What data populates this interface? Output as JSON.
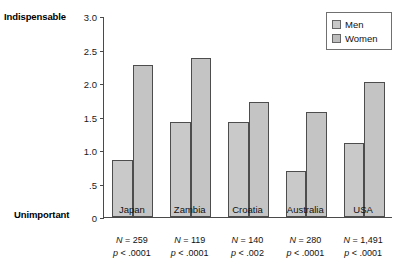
{
  "chart_data": {
    "type": "bar",
    "title": "",
    "xlabel": "",
    "ylabel": "",
    "ylim": [
      0,
      3.0
    ],
    "grid": false,
    "legend_position": "top-right",
    "axis_anchor_high": "Indispensable",
    "axis_anchor_low": "Unimportant",
    "categories": [
      "Japan",
      "Zambia",
      "Croatia",
      "Australia",
      "USA"
    ],
    "ytick_labels": [
      "3.0",
      "2.5",
      "2.0",
      "1.5",
      "1.0",
      ".5",
      "0"
    ],
    "ytick_values": [
      3.0,
      2.5,
      2.0,
      1.5,
      1.0,
      0.5,
      0
    ],
    "series": [
      {
        "name": "Men",
        "values": [
          0.85,
          1.42,
          1.42,
          0.68,
          1.11
        ]
      },
      {
        "name": "Women",
        "values": [
          2.27,
          2.38,
          1.71,
          1.57,
          2.01
        ]
      }
    ],
    "annotations": [
      {
        "category": "Japan",
        "n": "N = 259",
        "p": "p < .0001"
      },
      {
        "category": "Zambia",
        "n": "N = 119",
        "p": "p < .0001"
      },
      {
        "category": "Croatia",
        "n": "N = 140",
        "p": "p < .002"
      },
      {
        "category": "Australia",
        "n": "N = 280",
        "p": "p < .0001"
      },
      {
        "category": "USA",
        "n": "N = 1,491",
        "p": "p < .0001"
      }
    ],
    "colors": {
      "men_fill": "#c9c9c9",
      "women_fill": "#c4c4c4",
      "bar_border": "#4d4d4d",
      "axis": "#4a4a4a",
      "text": "#111111",
      "background": "#ffffff"
    }
  },
  "legend": {
    "items": [
      {
        "label": "Men"
      },
      {
        "label": "Women"
      }
    ]
  }
}
